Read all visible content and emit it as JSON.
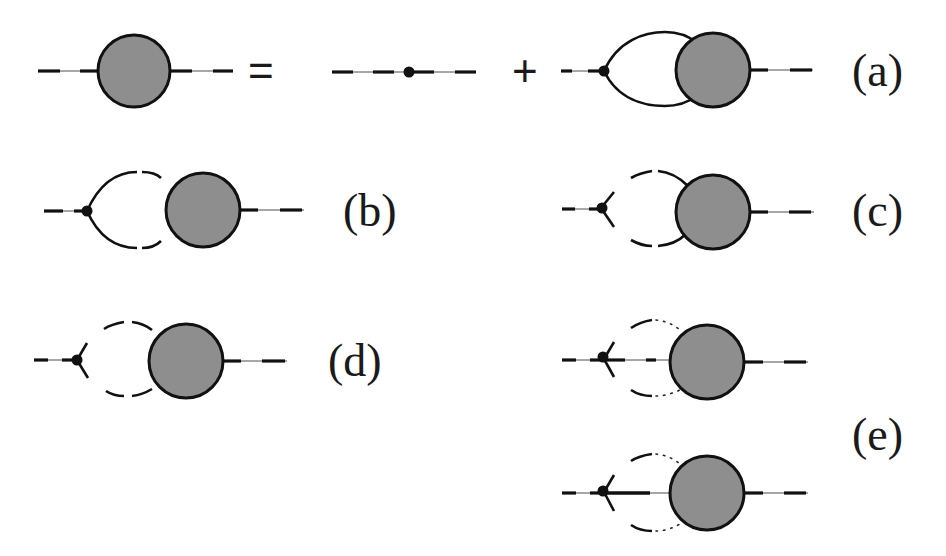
{
  "figure": {
    "colors": {
      "blob_fill": "#8e8e8e",
      "line": "#111111",
      "background": "#ffffff"
    },
    "equation_a": {
      "equals_sign": "=",
      "plus_sign": "+",
      "label": "(a)"
    },
    "panels": [
      {
        "id": "b",
        "label": "(b)",
        "loop": "solid lines broken by gaps"
      },
      {
        "id": "c",
        "label": "(c)",
        "loop": "dashed loop with three-leg vertex"
      },
      {
        "id": "d",
        "label": "(d)",
        "loop": "dashed loop with three-leg vertex"
      },
      {
        "id": "e",
        "label": "(e)",
        "loop": "dashed/dotted loop with four-leg vertex",
        "count": 2
      }
    ]
  }
}
